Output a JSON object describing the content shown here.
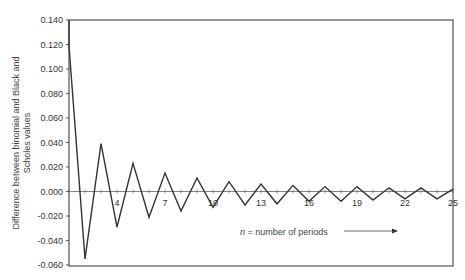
{
  "chart_data": {
    "type": "line",
    "title": "",
    "xlabel": "n = number of periods",
    "ylabel": "Difference between binomial and Black and Scholes values",
    "x": [
      1,
      2,
      3,
      4,
      5,
      6,
      7,
      8,
      9,
      10,
      11,
      12,
      13,
      14,
      15,
      16,
      17,
      18,
      19,
      20,
      21,
      22,
      23,
      24,
      25
    ],
    "series": [
      {
        "name": "Binomial minus Black-Scholes",
        "values": [
          0.119,
          -0.055,
          0.039,
          -0.029,
          0.023,
          -0.021,
          0.015,
          -0.016,
          0.011,
          -0.013,
          0.008,
          -0.011,
          0.006,
          -0.01,
          0.005,
          -0.008,
          0.004,
          -0.008,
          0.004,
          -0.007,
          0.003,
          -0.006,
          0.003,
          -0.006,
          0.002
        ]
      }
    ],
    "x_tick_labels": [
      "4",
      "7",
      "10",
      "13",
      "16",
      "19",
      "22",
      "25"
    ],
    "y_tick_labels": [
      "0.140",
      "0.120",
      "0.100",
      "0.080",
      "0.060",
      "0.040",
      "0.020",
      "0.000",
      "-0.020",
      "-0.040",
      "-0.060"
    ],
    "ylim": [
      -0.06,
      0.14
    ],
    "xlim": [
      1,
      25
    ],
    "grid": false,
    "legend": null,
    "annotation": "n = number of periods →"
  },
  "labels": {
    "ylabel_line1": "Difference between binomial and Black and",
    "ylabel_line2": "Scholes values",
    "note_n": "n",
    "note_rest": " = number of periods"
  }
}
